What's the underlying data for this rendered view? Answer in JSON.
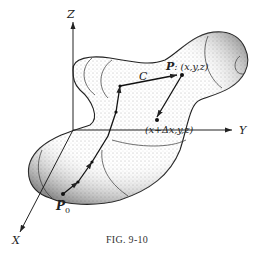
{
  "figure": {
    "caption": "FIG. 9-10",
    "axes": {
      "x_label": "X",
      "y_label": "Y",
      "z_label": "Z"
    },
    "curve_label": "C",
    "points": {
      "start": {
        "name": "P",
        "subscript": "0"
      },
      "end": {
        "name": "P",
        "coords": ": (x,y,z)"
      },
      "offset": {
        "coords": "(x+Δx,y,z)"
      }
    },
    "colors": {
      "ink": "#222222",
      "stipple": "#555555",
      "background": "#ffffff"
    }
  }
}
